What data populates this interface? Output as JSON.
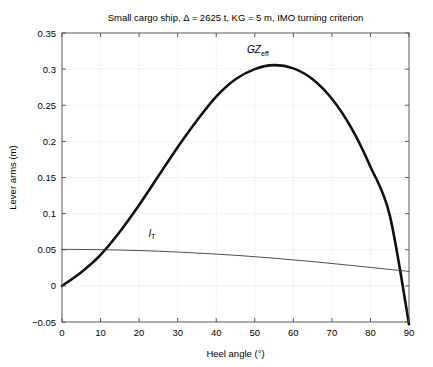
{
  "chart_data": {
    "type": "line",
    "title": "Small cargo ship, Δ = 2625 t, KG = 5 m, IMO turning criterion",
    "xlabel": "Heel angle (°)",
    "ylabel": "Lever arms (m)",
    "xlim": [
      0,
      90
    ],
    "ylim": [
      -0.05,
      0.35
    ],
    "xticks": [
      0,
      10,
      20,
      30,
      40,
      50,
      60,
      70,
      80,
      90
    ],
    "xtick_labels": [
      "0",
      "10",
      "20",
      "30",
      "40",
      "50",
      "60",
      "70",
      "80",
      "90"
    ],
    "yticks": [
      -0.05,
      0,
      0.05,
      0.1,
      0.15,
      0.2,
      0.25,
      0.3,
      0.35
    ],
    "ytick_labels": [
      "−0.05",
      "0",
      "0.05",
      "0.1",
      "0.15",
      "0.2",
      "0.25",
      "0.3",
      "0.35"
    ],
    "grid": true,
    "legend_position": "inline-annotations",
    "x": [
      0,
      5,
      10,
      15,
      20,
      25,
      30,
      35,
      40,
      45,
      50,
      55,
      60,
      65,
      70,
      75,
      80,
      85,
      90
    ],
    "series": [
      {
        "name": "GZ_eff",
        "label_text": "GZ",
        "label_sub": "eff",
        "label_x": 48,
        "label_y": 0.322,
        "linewidth": "thick",
        "color": "#101010",
        "values": [
          0.0,
          0.019,
          0.043,
          0.075,
          0.112,
          0.152,
          0.192,
          0.229,
          0.262,
          0.286,
          0.3,
          0.3055,
          0.301,
          0.286,
          0.259,
          0.219,
          0.165,
          0.098,
          -0.053
        ]
      },
      {
        "name": "l_T",
        "label_text": "l",
        "label_sub": "T",
        "label_x": 22.5,
        "label_y": 0.068,
        "linewidth": "thin",
        "color": "#3a3a3a",
        "values": [
          0.0505,
          0.0504,
          0.0501,
          0.0496,
          0.0489,
          0.048,
          0.0468,
          0.0455,
          0.044,
          0.0423,
          0.0404,
          0.0383,
          0.036,
          0.0336,
          0.031,
          0.0283,
          0.0255,
          0.0228,
          0.02
        ]
      }
    ],
    "annotations": [
      {
        "name": "gz-curve-label",
        "text": "GZeff"
      },
      {
        "name": "lt-curve-label",
        "text": "lT"
      }
    ]
  },
  "colors": {
    "background": "#ffffff",
    "grid": "#d0d0d0",
    "axis": "#4a4a4a",
    "gz_curve": "#101010",
    "lt_curve": "#3a3a3a"
  }
}
